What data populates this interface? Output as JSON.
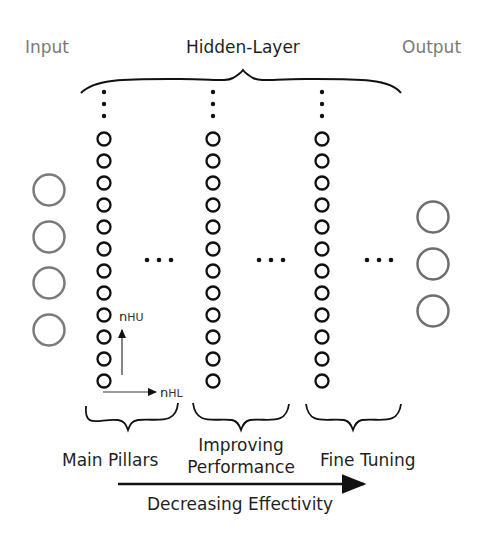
{
  "labels": {
    "input": "Input",
    "hidden": "Hidden-Layer",
    "output": "Output",
    "groups": [
      "Main Pillars",
      "Improving",
      "Performance",
      "Fine Tuning"
    ],
    "direction": "Decreasing Effectivity",
    "axis_units_main": "n",
    "axis_units_sub": "HU",
    "axis_layers_main": "n",
    "axis_layers_sub": "HL"
  },
  "network": {
    "input_neurons": 4,
    "hidden_columns_shown": 3,
    "neurons_per_hidden_column": 12,
    "output_neurons": 3
  },
  "colors": {
    "io_neuron": "#7a7a7a",
    "hidden_neuron": "#111111",
    "text": "#1f1f1f",
    "io_text": "#7a7a7a"
  }
}
